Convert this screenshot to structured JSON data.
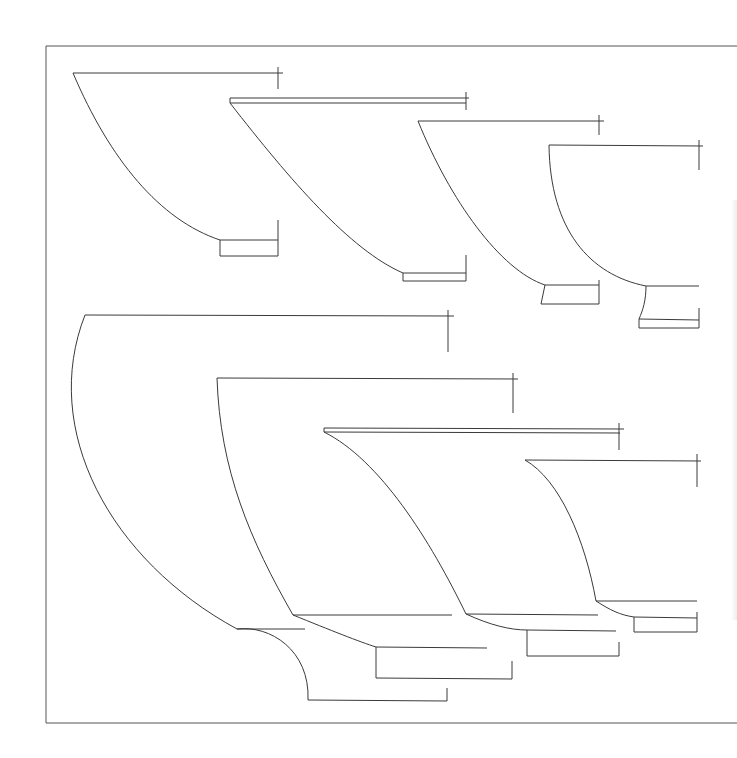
{
  "drawing": {
    "type": "vessel-profile-sections",
    "line_color": "#3a3a3a",
    "background": "#ffffff",
    "frame": {
      "x1": 46,
      "y1": 46,
      "x2": 737,
      "y2": 723
    },
    "profiles": [
      {
        "id": "profile-1",
        "paths": [
          "M73,73 L283,73",
          "M278,67 L278,89",
          "M73,73 C110,160 160,220 220,240",
          "M220,240 L278,240",
          "M278,220 L278,256",
          "M220,240 L220,256 L278,256"
        ]
      },
      {
        "id": "profile-2",
        "paths": [
          "M230,98 L469,98",
          "M230,103 L466,103",
          "M230,98 L230,103",
          "M466,92 L466,110",
          "M230,103 C290,180 350,250 403,273",
          "M403,273 L466,273",
          "M466,255 L466,281",
          "M403,273 L403,281 L466,281"
        ]
      },
      {
        "id": "profile-3",
        "paths": [
          "M418,121 L604,121",
          "M599,115 L599,135",
          "M418,121 C450,200 500,270 545,285",
          "M545,285 L599,285",
          "M599,280 L599,304",
          "M545,285 L541,304 L599,304"
        ]
      },
      {
        "id": "profile-4",
        "paths": [
          "M549,145 L703,146",
          "M699,140 L699,170",
          "M549,145 C550,230 590,275 646,286",
          "M646,286 L699,286",
          "M646,286 C646,300 643,310 639,319",
          "M699,308 L699,328",
          "M639,319 L699,320",
          "M639,319 L639,328 L699,328"
        ]
      },
      {
        "id": "profile-5",
        "paths": [
          "M85,315 L454,316",
          "M448,310 L448,352",
          "M85,315 C40,430 110,560 237,629",
          "M237,629 L305,629",
          "M237,629 C270,625 310,650 308,700",
          "M308,700 L447,701",
          "M447,688 L447,701"
        ]
      },
      {
        "id": "profile-6",
        "paths": [
          "M217,378 L518,379",
          "M513,373 L513,413",
          "M217,378 C220,470 250,540 293,615",
          "M293,615 L452,615",
          "M293,615 C330,630 360,642 376,647",
          "M376,647 L487,648",
          "M376,647 L376,678 L512,679",
          "M512,661 L512,679"
        ]
      },
      {
        "id": "profile-7",
        "paths": [
          "M324,428 L624,429",
          "M324,432 L620,433",
          "M324,428 L324,432",
          "M619,423 L619,450",
          "M324,432 C380,460 430,540 466,614",
          "M466,614 L598,615",
          "M466,614 C490,625 510,630 527,630",
          "M527,630 L616,631",
          "M527,630 L527,656 L619,656",
          "M619,642 L619,656"
        ]
      },
      {
        "id": "profile-8",
        "paths": [
          "M525,460 L701,461",
          "M697,454 L697,487",
          "M525,460 C560,480 585,540 596,601",
          "M596,601 L697,601",
          "M596,601 C610,610 620,615 634,617",
          "M634,617 L697,618",
          "M697,612 L697,632",
          "M634,617 L634,632 L697,632"
        ]
      }
    ]
  }
}
